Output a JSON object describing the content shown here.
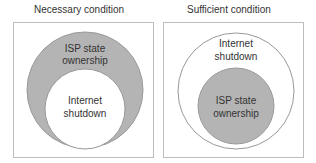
{
  "panels": [
    {
      "title": "Necessary condition",
      "outer": {
        "label_line1": "ISP state",
        "label_line2": "ownership",
        "fill": "#b4b4b4"
      },
      "inner": {
        "label_line1": "Internet",
        "label_line2": "shutdown",
        "fill": "#ffffff"
      }
    },
    {
      "title": "Sufficient condition",
      "outer": {
        "label_line1": "Internet",
        "label_line2": "shutdown",
        "fill": "#ffffff"
      },
      "inner": {
        "label_line1": "ISP state",
        "label_line2": "ownership",
        "fill": "#b4b4b4"
      }
    }
  ],
  "colors": {
    "border": "#bdbdbd",
    "circle_stroke": "#999999",
    "gray_fill": "#b4b4b4",
    "text": "#333333"
  }
}
